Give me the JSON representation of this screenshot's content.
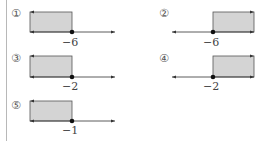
{
  "options": [
    {
      "number": "①",
      "point_label": "−6",
      "point_value": -6,
      "shade_direction": "left",
      "column": "left",
      "row": 0
    },
    {
      "number": "②",
      "point_label": "−6",
      "point_value": -6,
      "shade_direction": "right",
      "column": "right",
      "row": 0
    },
    {
      "number": "③",
      "point_label": "−2",
      "point_value": -2,
      "shade_direction": "left",
      "column": "left",
      "row": 1
    },
    {
      "number": "④",
      "point_label": "−2",
      "point_value": -2,
      "shade_direction": "right",
      "column": "right",
      "row": 1
    },
    {
      "number": "⑤",
      "point_label": "−1",
      "point_value": -1,
      "shade_direction": "left",
      "column": "left",
      "row": 2
    }
  ],
  "colors": {
    "shade_fill": "#d4d4d4",
    "shade_stroke": "#555555",
    "axis": "#333333",
    "point": "#111111"
  }
}
